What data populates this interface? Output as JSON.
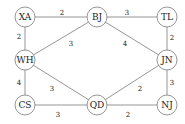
{
  "graph": {
    "nodes": [
      {
        "id": "XA",
        "label": "XA",
        "x": 25,
        "y": 17
      },
      {
        "id": "BJ",
        "label": "BJ",
        "x": 97,
        "y": 17
      },
      {
        "id": "TL",
        "label": "TL",
        "x": 167,
        "y": 17
      },
      {
        "id": "WH",
        "label": "WH",
        "x": 25,
        "y": 60
      },
      {
        "id": "JN",
        "label": "JN",
        "x": 167,
        "y": 60
      },
      {
        "id": "CS",
        "label": "CS",
        "x": 25,
        "y": 105
      },
      {
        "id": "QD",
        "label": "QD",
        "x": 97,
        "y": 105
      },
      {
        "id": "NJ",
        "label": "NJ",
        "x": 167,
        "y": 105
      }
    ],
    "edges": [
      {
        "from": "XA",
        "to": "BJ",
        "weight": "2",
        "lx": 62,
        "ly": 13
      },
      {
        "from": "BJ",
        "to": "TL",
        "weight": "3",
        "lx": 127,
        "ly": 13
      },
      {
        "from": "XA",
        "to": "WH",
        "weight": "2",
        "lx": 19,
        "ly": 37
      },
      {
        "from": "WH",
        "to": "BJ",
        "weight": "3",
        "lx": 71,
        "ly": 44
      },
      {
        "from": "BJ",
        "to": "JN",
        "weight": "4",
        "lx": 125,
        "ly": 44
      },
      {
        "from": "TL",
        "to": "JN",
        "weight": "2",
        "lx": 172,
        "ly": 38
      },
      {
        "from": "WH",
        "to": "CS",
        "weight": "4",
        "lx": 19,
        "ly": 83
      },
      {
        "from": "WH",
        "to": "QD",
        "weight": "3",
        "lx": 52,
        "ly": 89
      },
      {
        "from": "CS",
        "to": "QD",
        "weight": "3",
        "lx": 58,
        "ly": 115
      },
      {
        "from": "QD",
        "to": "JN",
        "weight": "2",
        "lx": 140,
        "ly": 89
      },
      {
        "from": "JN",
        "to": "NJ",
        "weight": "3",
        "lx": 172,
        "ly": 83
      },
      {
        "from": "QD",
        "to": "NJ",
        "weight": "2",
        "lx": 128,
        "ly": 115
      }
    ]
  }
}
